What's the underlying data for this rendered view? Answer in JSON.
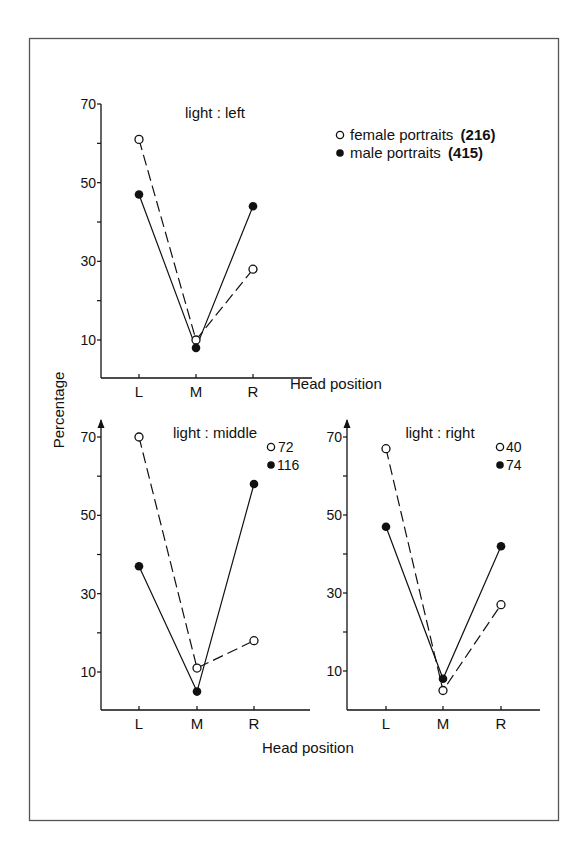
{
  "figure": {
    "y_axis_label": "Percentage",
    "x_axis_label": "Head position",
    "legend": {
      "female": {
        "label": "female portraits",
        "count": "(216)",
        "marker": "open-circle"
      },
      "male": {
        "label": "male portraits",
        "count": "(415)",
        "marker": "filled-circle"
      }
    },
    "colors": {
      "ink": "#111111",
      "frame": "#555555",
      "background": "#ffffff"
    }
  },
  "chart_data": [
    {
      "type": "line",
      "title": "light : left",
      "categories": [
        "L",
        "M",
        "R"
      ],
      "xlabel": "Head position",
      "ylabel": "Percentage",
      "yticks": [
        10,
        30,
        50,
        70
      ],
      "ylim": [
        0,
        70
      ],
      "grid": false,
      "series": [
        {
          "name": "female portraits (216)",
          "marker": "open-circle",
          "line": "dashed",
          "values": [
            61,
            10,
            28
          ]
        },
        {
          "name": "male portraits (415)",
          "marker": "filled-circle",
          "line": "solid",
          "values": [
            47,
            8,
            44
          ]
        }
      ],
      "legend_position": "right"
    },
    {
      "type": "line",
      "title": "light : middle",
      "categories": [
        "L",
        "M",
        "R"
      ],
      "xlabel": "Head position",
      "ylabel": "Percentage",
      "yticks": [
        10,
        30,
        50,
        70
      ],
      "ylim": [
        0,
        70
      ],
      "grid": false,
      "series": [
        {
          "name": "female",
          "count": "72",
          "marker": "open-circle",
          "line": "dashed",
          "values": [
            70,
            11,
            18
          ]
        },
        {
          "name": "male",
          "count": "116",
          "marker": "filled-circle",
          "line": "solid",
          "values": [
            37,
            5,
            58
          ]
        }
      ],
      "legend_position": "top-right"
    },
    {
      "type": "line",
      "title": "light : right",
      "categories": [
        "L",
        "M",
        "R"
      ],
      "xlabel": "Head position",
      "ylabel": "Percentage",
      "yticks": [
        10,
        30,
        50,
        70
      ],
      "ylim": [
        0,
        70
      ],
      "grid": false,
      "series": [
        {
          "name": "female",
          "count": "40",
          "marker": "open-circle",
          "line": "dashed",
          "values": [
            67,
            5,
            27
          ]
        },
        {
          "name": "male",
          "count": "74",
          "marker": "filled-circle",
          "line": "solid",
          "values": [
            47,
            8,
            42
          ]
        }
      ],
      "legend_position": "top-right"
    }
  ]
}
